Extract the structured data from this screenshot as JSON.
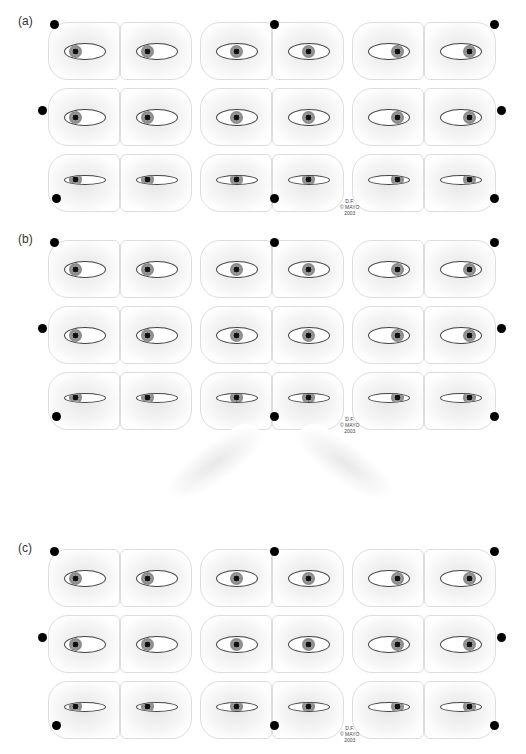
{
  "figure": {
    "panels": [
      {
        "label": "(a)",
        "top": 18,
        "description": "Nine gaze positions, one eyelid lifted by a finger"
      },
      {
        "label": "(b)",
        "top": 236,
        "description": "Nine gaze positions, normal"
      },
      {
        "label": "(c)",
        "top": 545,
        "description": "Nine gaze positions, variant"
      }
    ],
    "credit": {
      "line1": "D.F.",
      "line2": "© MAYO",
      "line3": "2003"
    },
    "colors": {
      "background": "#ffffff",
      "outline": "#dddddd",
      "dot": "#000000"
    }
  }
}
